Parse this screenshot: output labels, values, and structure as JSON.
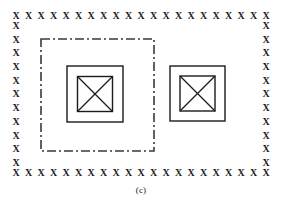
{
  "figure": {
    "caption": "(c)",
    "background_color": "#ffffff",
    "stroke_color": "#1b1b1b",
    "width": 282,
    "height": 205
  },
  "boundary": {
    "name": "x-mark-boundary",
    "marker_glyph": "X",
    "top_count": 21,
    "bottom_count": 21,
    "left_count": 11,
    "right_count": 11,
    "description": "Dotted boundary of X markers enclosing the domain"
  },
  "dashdot_region": {
    "name": "dash-dot-subdomain",
    "line_style": "dash-dot",
    "x": 40,
    "y": 38,
    "width": 115,
    "height": 114,
    "color": "#3a3a3a"
  },
  "square_groups": [
    {
      "name": "left-square-group",
      "outer": {
        "x": 66,
        "y": 65,
        "size": 58
      },
      "inner": {
        "x": 12,
        "y": 12,
        "size": 35
      },
      "has_diagonals": true,
      "inside_dashdot": true
    },
    {
      "name": "right-square-group",
      "outer": {
        "x": 169,
        "y": 65,
        "size": 57
      },
      "inner": {
        "x": 12,
        "y": 12,
        "size": 35
      },
      "has_diagonals": true,
      "inside_dashdot": false
    }
  ]
}
